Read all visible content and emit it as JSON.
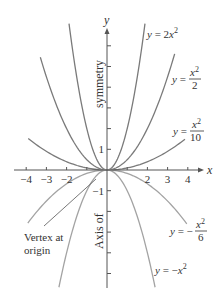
{
  "figure": {
    "type": "parabola-family",
    "x_axis": {
      "label": "x",
      "ticks": [
        {
          "value": -4,
          "label": "−4"
        },
        {
          "value": -3,
          "label": "−3"
        },
        {
          "value": -2,
          "label": "−2"
        },
        {
          "value": -1,
          "label": ""
        },
        {
          "value": 1,
          "label": ""
        },
        {
          "value": 2,
          "label": "2"
        },
        {
          "value": 3,
          "label": "3"
        },
        {
          "value": 4,
          "label": "4"
        }
      ]
    },
    "y_axis": {
      "label": "y",
      "ticks": [
        {
          "value": 1,
          "label": "1"
        },
        {
          "value": 2,
          "label": ""
        },
        {
          "value": 3,
          "label": ""
        },
        {
          "value": 4,
          "label": ""
        },
        {
          "value": 5,
          "label": ""
        },
        {
          "value": 6,
          "label": ""
        },
        {
          "value": -1,
          "label": "−1"
        },
        {
          "value": -2,
          "label": ""
        },
        {
          "value": -3,
          "label": ""
        },
        {
          "value": -4,
          "label": ""
        },
        {
          "value": -5,
          "label": ""
        }
      ]
    },
    "axis_of_symmetry_label_top": "symmetry",
    "axis_of_symmetry_label_bottom": "Axis of",
    "vertex_note": {
      "line1": "Vertex at",
      "line2": "origin"
    },
    "curves": [
      {
        "name": "y-2x2",
        "a": 2,
        "xmin": -1.88,
        "xmax": 1.88,
        "color": "#7a7a7a",
        "label_prefix": "y = 2x",
        "label_sup": "2"
      },
      {
        "name": "y-x2-over-2",
        "a": 0.5,
        "xmin": -3.3,
        "xmax": 3.35,
        "color": "#7a7a7a",
        "label_prefix": "y = ",
        "label_num": "x²",
        "label_den": "2"
      },
      {
        "name": "y-x2-over-10",
        "a": 0.1,
        "xmin": -3.9,
        "xmax": 3.86,
        "color": "#7a7a7a",
        "label_prefix": "y = ",
        "label_num": "x²",
        "label_den": "10"
      },
      {
        "name": "y-neg-x2-over-6",
        "a": -0.16667,
        "xmin": -3.92,
        "xmax": 3.95,
        "color": "#a3a3a3",
        "label_prefix": "y = −",
        "label_num": "x²",
        "label_den": "6"
      },
      {
        "name": "y-neg-x2",
        "a": -1,
        "xmin": -2.38,
        "xmax": 2.38,
        "color": "#a3a3a3",
        "label_prefix": "y = −x",
        "label_sup": "2"
      }
    ],
    "colors": {
      "axis": "#555555",
      "upper_curves": "#7a7a7a",
      "lower_curves": "#a3a3a3",
      "text": "#333333"
    }
  }
}
